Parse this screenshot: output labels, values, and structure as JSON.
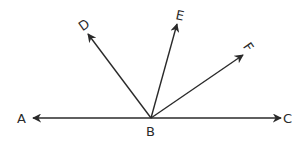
{
  "diagram": {
    "type": "geometry-rays",
    "vertex": {
      "label": "B",
      "x": 151,
      "y": 118
    },
    "line": {
      "from": "A",
      "to": "C"
    },
    "points": {
      "A": {
        "label": "A",
        "tip": [
          33,
          118
        ],
        "label_pos": [
          17,
          123
        ],
        "rotate": 0
      },
      "C": {
        "label": "C",
        "tip": [
          281,
          118
        ],
        "label_pos": [
          283,
          123
        ],
        "rotate": 0
      },
      "D": {
        "label": "D",
        "tip": [
          88,
          34
        ],
        "label_pos": [
          79,
          30
        ],
        "rotate": -35
      },
      "E": {
        "label": "E",
        "tip": [
          177,
          24
        ],
        "label_pos": [
          176,
          20
        ],
        "rotate": 12
      },
      "F": {
        "label": "F",
        "tip": [
          243,
          55
        ],
        "label_pos": [
          245,
          52
        ],
        "rotate": 55
      },
      "B": {
        "label": "B",
        "label_pos": [
          146,
          136
        ]
      }
    },
    "rays": [
      "BA",
      "BC",
      "BD",
      "BE",
      "BF"
    ],
    "stroke_color": "#2a2a2a"
  }
}
